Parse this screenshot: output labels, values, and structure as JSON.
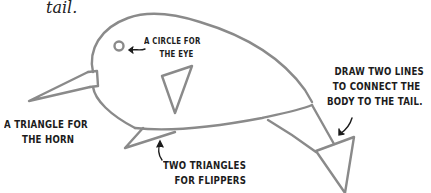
{
  "caption": {
    "text": "tail."
  },
  "labels": {
    "eye": {
      "line1": "A circle for",
      "line2": "the eye"
    },
    "horn": {
      "line1": "A triangle for",
      "line2": "the horn"
    },
    "tail_lines": {
      "line1": "Draw two lines",
      "line2": "to connect the",
      "line3": "body to the tail."
    },
    "flippers": {
      "line1": "Two triangles",
      "line2": "for flippers"
    }
  },
  "colors": {
    "stroke": "#8a8a8a",
    "text": "#1c1c1c",
    "arrow": "#1c1c1c",
    "background": "#ffffff"
  }
}
